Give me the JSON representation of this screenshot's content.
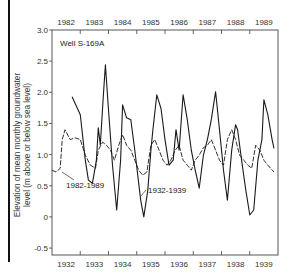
{
  "chart_data": {
    "type": "line",
    "title": "Well S-169A",
    "ylabel_line1": "Elevation of mean monthly groundwater",
    "ylabel_line2": "level (m above or below sea level)",
    "top_axis_ticks": [
      "1982",
      "1983",
      "1984",
      "1985",
      "1986",
      "1987",
      "1988",
      "1989"
    ],
    "bottom_axis_ticks": [
      "1932",
      "1933",
      "1934",
      "1935",
      "1936",
      "1937",
      "1938",
      "1939"
    ],
    "y_ticks": [
      "3.0",
      "2.5",
      "2.0",
      "1.5",
      "1.0",
      "0.5",
      "0",
      "-0.5"
    ],
    "ylim": [
      -0.6,
      3.0
    ],
    "grid": false,
    "series": [
      {
        "name": "1932-1939",
        "style": "solid",
        "x_years": [
          0.71,
          1.0,
          1.18,
          1.29,
          1.43,
          1.57,
          1.64,
          1.71,
          1.82,
          1.89,
          2.0,
          2.14,
          2.29,
          2.43,
          2.5,
          2.64,
          2.79,
          2.93,
          3.14,
          3.25,
          3.39,
          3.5,
          3.57,
          3.71,
          3.86,
          4.0,
          4.14,
          4.29,
          4.39,
          4.5,
          4.64,
          4.79,
          4.93,
          5.07,
          5.21,
          5.36,
          5.5,
          5.64,
          5.79,
          5.93,
          6.07,
          6.21,
          6.36,
          6.5,
          6.57,
          6.71,
          6.86,
          7.0,
          7.14,
          7.29,
          7.43,
          7.5,
          7.64,
          7.79,
          7.86
        ],
        "values": [
          1.93,
          1.64,
          0.91,
          0.59,
          0.54,
          0.91,
          1.43,
          1.15,
          1.96,
          2.44,
          1.72,
          0.83,
          0.11,
          0.91,
          1.8,
          1.59,
          1.56,
          1.07,
          0.27,
          0.0,
          0.43,
          1.07,
          1.4,
          1.96,
          1.74,
          1.24,
          0.83,
          0.91,
          1.4,
          1.07,
          1.96,
          1.56,
          1.07,
          0.75,
          0.46,
          0.99,
          1.24,
          1.56,
          2.01,
          1.4,
          0.75,
          0.27,
          1.07,
          1.48,
          1.4,
          0.91,
          0.43,
          0.03,
          0.11,
          0.91,
          1.24,
          1.88,
          1.64,
          1.24,
          1.1
        ]
      },
      {
        "name": "1982-1989",
        "style": "dashed",
        "x_years": [
          0.0,
          0.14,
          0.29,
          0.36,
          0.46,
          0.64,
          0.82,
          1.0,
          1.18,
          1.36,
          1.54,
          1.64,
          1.79,
          1.93,
          2.07,
          2.21,
          2.36,
          2.5,
          2.64,
          2.79,
          2.93,
          3.07,
          3.21,
          3.36,
          3.5,
          3.64,
          3.79,
          3.93,
          4.07,
          4.21,
          4.36,
          4.5,
          4.64,
          4.79,
          4.93,
          5.07,
          5.21,
          5.36,
          5.5,
          5.64,
          5.79,
          5.93,
          6.07,
          6.21,
          6.36,
          6.5,
          6.64,
          6.79,
          6.93,
          7.07,
          7.21,
          7.36,
          7.5,
          7.64,
          7.86
        ],
        "values": [
          0.75,
          0.72,
          0.78,
          1.24,
          1.4,
          1.24,
          1.27,
          1.24,
          0.99,
          0.83,
          0.78,
          1.07,
          1.2,
          1.15,
          1.07,
          0.91,
          1.15,
          1.32,
          1.15,
          1.07,
          0.91,
          0.75,
          0.67,
          0.72,
          1.15,
          1.24,
          1.07,
          0.91,
          0.83,
          0.91,
          1.07,
          1.15,
          0.91,
          0.83,
          0.75,
          0.91,
          0.99,
          1.11,
          1.15,
          1.24,
          1.07,
          0.91,
          0.83,
          1.24,
          1.4,
          1.24,
          0.99,
          0.91,
          0.83,
          0.78,
          1.15,
          1.07,
          0.91,
          0.83,
          0.72
        ]
      }
    ],
    "annotations": [
      {
        "text": "1982-1989",
        "target_series": "1982-1989"
      },
      {
        "text": "1932-1939",
        "target_series": "1932-1939"
      }
    ]
  }
}
